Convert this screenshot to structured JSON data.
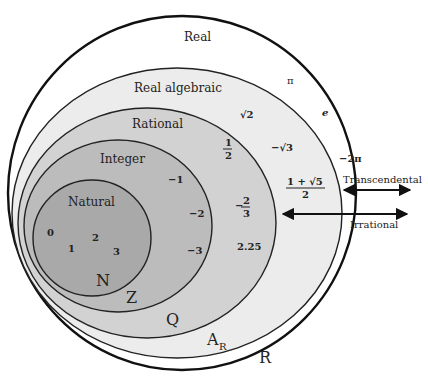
{
  "diagram": {
    "sets": [
      {
        "name": "Real",
        "symbol": "R",
        "fill": "#ffffff"
      },
      {
        "name": "Real algebraic",
        "symbol": "A",
        "symbol_sub": "R",
        "fill": "#ececec"
      },
      {
        "name": "Rational",
        "symbol": "Q",
        "fill": "#d2d2d2"
      },
      {
        "name": "Integer",
        "symbol": "Z",
        "fill": "#bcbcbc"
      },
      {
        "name": "Natural",
        "symbol": "N",
        "fill": "#a9a9a9"
      }
    ],
    "members": {
      "natural": [
        "0",
        "1",
        "2",
        "3"
      ],
      "integer": [
        "−1",
        "−2",
        "−3"
      ],
      "rational": {
        "half_num": "1",
        "half_den": "2",
        "neg_two_thirds_sign": "−",
        "two_thirds_num": "2",
        "two_thirds_den": "3",
        "decimal": "2.25"
      },
      "algebraic": {
        "sqrt2": "√2",
        "neg_sqrt3": "−√3",
        "golden_num": "1 + √5",
        "golden_den": "2"
      },
      "transcendental": [
        "π",
        "e",
        "−2π"
      ]
    },
    "arrows": [
      {
        "label": "Transcendental"
      },
      {
        "label": "Irrational"
      }
    ]
  }
}
